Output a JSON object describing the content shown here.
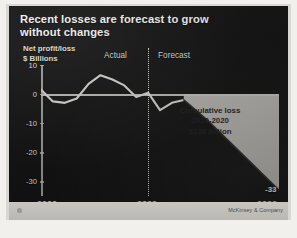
{
  "title": {
    "line1": "Recent losses are forecast to grow",
    "line2": "without changes"
  },
  "axis_title": {
    "line1": "Net profit/loss",
    "line2": "$ Billions"
  },
  "periods": {
    "actual": "Actual",
    "forecast": "Forecast"
  },
  "annotation": {
    "line1": "Cumulative loss",
    "line2": "2010-2020",
    "line3": "$238 billion"
  },
  "endpoint_label": "-33",
  "source": "McKinsey & Company",
  "colors": {
    "panel_background": "#121212",
    "line": "#d8d7d2",
    "forecast_fill": "#c9c7c2",
    "text": "#f4f4f2",
    "footer": "#c2c0bb"
  },
  "chart_data": {
    "type": "area",
    "title": "Recent losses are forecast to grow without changes",
    "subtitle": "",
    "xlabel": "",
    "ylabel": "Net profit/loss, $ Billions",
    "xlim": [
      2000,
      2020
    ],
    "ylim": [
      -35,
      10
    ],
    "xticks": [
      2000,
      2009,
      2020
    ],
    "yticks": [
      10,
      0,
      -10,
      -20,
      -30
    ],
    "grid": false,
    "legend": "none",
    "divider_x": 2009,
    "series": [
      {
        "name": "Net profit/loss (actual)",
        "period": "actual",
        "x": [
          2000,
          2001,
          2002,
          2003,
          2004,
          2005,
          2006,
          2007,
          2008,
          2009
        ],
        "values": [
          1.5,
          -2.5,
          -3.0,
          -1.5,
          3.5,
          6.5,
          5.0,
          3.0,
          -1.0,
          0.5
        ]
      },
      {
        "name": "Net profit/loss (actual, late)",
        "period": "actual",
        "x": [
          2009,
          2010,
          2011,
          2012
        ],
        "values": [
          0.5,
          -5.5,
          -3.0,
          -2.0
        ]
      },
      {
        "name": "Net profit/loss (forecast)",
        "period": "forecast",
        "x": [
          2012,
          2014,
          2016,
          2018,
          2020
        ],
        "values": [
          -2.0,
          -9.0,
          -17.0,
          -25.0,
          -33.0
        ]
      }
    ],
    "annotations": [
      {
        "text": "Cumulative loss 2010-2020 $238 billion",
        "value": -238,
        "units": "billion USD",
        "period": "2010-2020"
      },
      {
        "text": "-33",
        "x": 2020,
        "y": -33
      }
    ]
  }
}
